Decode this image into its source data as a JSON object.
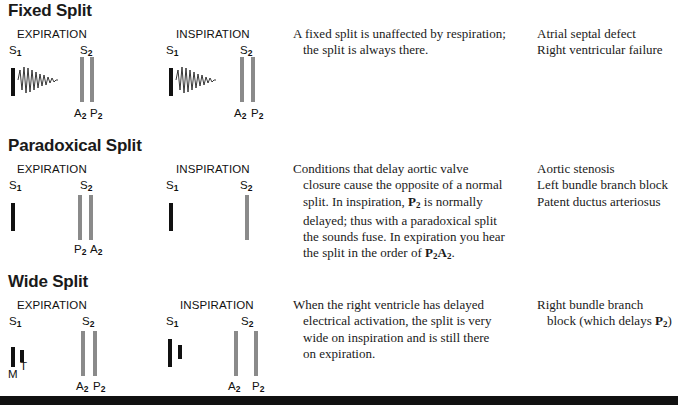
{
  "sections": [
    {
      "title": "Fixed Split",
      "expiration": {
        "phase_label": "EXPIRATION",
        "s1": "S",
        "s1_sub": "1",
        "s2": "S",
        "s2_sub": "2",
        "first": "A",
        "first_sub": "2",
        "second": "P",
        "second_sub": "2"
      },
      "inspiration": {
        "phase_label": "INSPIRATION",
        "s1": "S",
        "s1_sub": "1",
        "s2": "S",
        "s2_sub": "2",
        "first": "A",
        "first_sub": "2",
        "second": "P",
        "second_sub": "2"
      },
      "description": [
        "A fixed split is unaffected by respiration;",
        "the split is always there."
      ],
      "causes": [
        "Atrial septal defect",
        "Right ventricular failure"
      ]
    },
    {
      "title": "Paradoxical Split",
      "expiration": {
        "phase_label": "EXPIRATION",
        "s1": "S",
        "s1_sub": "1",
        "s2": "S",
        "s2_sub": "2",
        "first": "P",
        "first_sub": "2",
        "second": "A",
        "second_sub": "2"
      },
      "inspiration": {
        "phase_label": "INSPIRATION",
        "s1": "S",
        "s1_sub": "1",
        "s2": "S",
        "s2_sub": "2"
      },
      "description": [
        "Conditions that delay aortic valve",
        "closure cause the opposite of a normal",
        "split. In inspiration, ",
        "P",
        "2",
        " is normally",
        "delayed; thus with a paradoxical split",
        "the sounds fuse. In expiration you hear",
        "the split in the order of ",
        "P",
        "2",
        "A",
        "2",
        "."
      ],
      "causes": [
        "Aortic stenosis",
        "Left bundle branch block",
        "Patent ductus arteriosus"
      ]
    },
    {
      "title": "Wide Split",
      "expiration": {
        "phase_label": "EXPIRATION",
        "s1": "S",
        "s1_sub": "1",
        "s2": "S",
        "s2_sub": "2",
        "first": "A",
        "first_sub": "2",
        "second": "P",
        "second_sub": "2",
        "m": "M",
        "t": "T"
      },
      "inspiration": {
        "phase_label": "INSPIRATION",
        "s1": "S",
        "s1_sub": "1",
        "s2": "S",
        "s2_sub": "2",
        "first": "A",
        "first_sub": "2",
        "second": "P",
        "second_sub": "2"
      },
      "description": [
        "When the right ventricle has delayed",
        "electrical activation, the split is very",
        "wide on inspiration and is still there",
        "on expiration."
      ],
      "causes": [
        "Right bundle branch",
        "block (which delays ",
        "P",
        "2",
        ")"
      ]
    }
  ],
  "colors": {
    "s1_bar": "#111111",
    "s2_bar": "#8a8a8a",
    "footer_bar": "#111111"
  }
}
